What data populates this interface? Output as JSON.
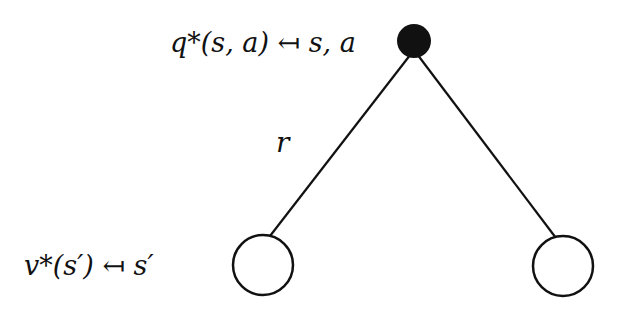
{
  "diagram": {
    "type": "backup-diagram",
    "root": {
      "label": "q*(s, a) ↤ s, a",
      "kind": "action-node",
      "fill": "#111111"
    },
    "edge_label": "r",
    "children": [
      {
        "label": "v*(s′) ↤ s′",
        "kind": "state-node",
        "fill": "#ffffff"
      },
      {
        "label": "",
        "kind": "state-node",
        "fill": "#ffffff"
      }
    ]
  }
}
